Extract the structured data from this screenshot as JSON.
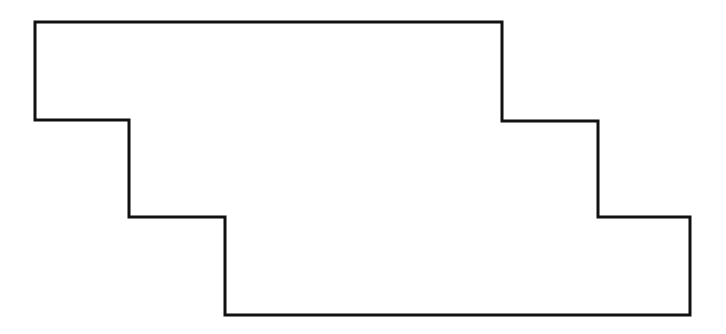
{
  "diagram": {
    "type": "rectilinear-polygon",
    "stroke_color": "#111111",
    "fill_color": "#ffffff",
    "stroke_width": 3,
    "points": "35,22 502,22 502,121 598,121 598,217 690,217 690,315 225,315 225,217 129,217 129,120 35,120"
  }
}
